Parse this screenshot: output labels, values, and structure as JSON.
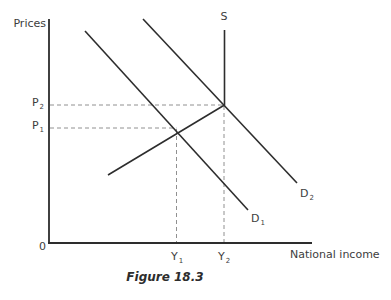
{
  "figure": {
    "y_axis_label": "Prices",
    "x_axis_label": "National income",
    "origin_label": "0",
    "caption": "Figure 18.3",
    "supply_label": "S",
    "demand1": {
      "base": "D",
      "sub": "1"
    },
    "demand2": {
      "base": "D",
      "sub": "2"
    },
    "price1": {
      "base": "P",
      "sub": "1"
    },
    "price2": {
      "base": "P",
      "sub": "2"
    },
    "income1": {
      "base": "Y",
      "sub": "1"
    },
    "income2": {
      "base": "Y",
      "sub": "2"
    },
    "colors": {
      "curve": "#2d2d2d",
      "axis": "#2d2d2d",
      "dashed": "#909090",
      "text": "#3d3d3d"
    },
    "paths": {
      "axes": "M49 19 L49 243 M48 243 L312 243",
      "supply": "M108 175 L224.5 105 L224.5 30",
      "demand1": "M85 31 L248 210",
      "demand2": "M143 19 L297 183",
      "dash_p2": "M50 105 L224 105",
      "dash_y2": "M224 106 L224 242",
      "dash_p1": "M50 128 L176.5 128",
      "dash_y1": "M176.5 129 L176.5 242"
    }
  }
}
